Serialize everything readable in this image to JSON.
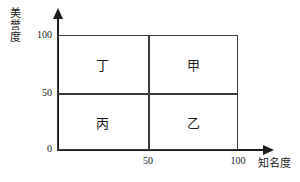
{
  "chart_data": {
    "type": "scatter",
    "title": "",
    "xlabel": "知名度",
    "ylabel": "美誉度",
    "xlim": [
      0,
      100
    ],
    "ylim": [
      0,
      100
    ],
    "grid": false,
    "legend": "none",
    "x_ticks": [
      "50",
      "100"
    ],
    "y_ticks": [
      "0",
      "50",
      "100"
    ],
    "quadrants": [
      {
        "id": "top-left",
        "label": "丁",
        "x_range": [
          0,
          50
        ],
        "y_range": [
          50,
          100
        ]
      },
      {
        "id": "top-right",
        "label": "甲",
        "x_range": [
          50,
          100
        ],
        "y_range": [
          50,
          100
        ]
      },
      {
        "id": "bottom-left",
        "label": "丙",
        "x_range": [
          0,
          50
        ],
        "y_range": [
          0,
          50
        ]
      },
      {
        "id": "bottom-right",
        "label": "乙",
        "x_range": [
          50,
          100
        ],
        "y_range": [
          0,
          50
        ]
      }
    ]
  },
  "axes": {
    "y_title": "美誉度",
    "x_title": "知名度",
    "y_tick_100": "100",
    "y_tick_50": "50",
    "y_tick_0": "0",
    "x_tick_50": "50",
    "x_tick_100": "100"
  },
  "quadrant_labels": {
    "top_left": "丁",
    "top_right": "甲",
    "bottom_left": "丙",
    "bottom_right": "乙"
  },
  "colors": {
    "axis": "#1c1c1c",
    "box": "#3a3a3a",
    "text": "#1a1a1a",
    "background": "#ffffff"
  }
}
